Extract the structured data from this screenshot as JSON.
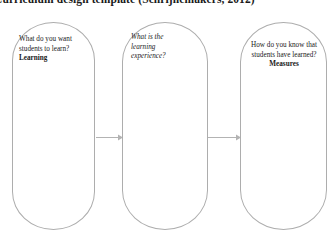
{
  "title": {
    "text": "Curriculum design template (Schrijnemakers, 2012)"
  },
  "diagram": {
    "type": "three-stage-flow",
    "stroke_color": "#adadad",
    "arrow_color": "#b3b3b3",
    "text_color": "#1a1a1a",
    "nodes": [
      {
        "id": "learning",
        "shape": "stadium",
        "question": "What do you want students to learn?",
        "accent": "Learning",
        "accent_style": "bold",
        "question_style": "normal",
        "align": "left"
      },
      {
        "id": "experience",
        "shape": "stadium",
        "question": "What is the learning experience?",
        "accent": "",
        "accent_style": "none",
        "question_style": "italic",
        "align": "left"
      },
      {
        "id": "measures",
        "shape": "stadium",
        "question": "How do you know that students have learned?",
        "accent": "Measures",
        "accent_style": "bold",
        "question_style": "normal",
        "align": "center"
      }
    ],
    "connectors": [
      {
        "id": "arrow-learning-to-experience",
        "from": "learning",
        "to": "experience",
        "direction": "right"
      },
      {
        "id": "arrow-experience-to-measures",
        "from": "experience",
        "to": "measures",
        "direction": "right"
      }
    ]
  }
}
